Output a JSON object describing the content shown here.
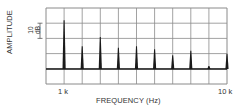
{
  "chart_data": {
    "type": "bar",
    "subtype": "spectrum-line",
    "title": "",
    "xlabel": "FREQUENCY (Hz)",
    "ylabel": "AMPLITUDE",
    "y_scale_annotation": "10 dB",
    "y_units_per_division": 10,
    "x_ticks": [
      {
        "value": 1000,
        "label": "1 k"
      },
      {
        "value": 10000,
        "label": "10 k"
      }
    ],
    "xlim": [
      0,
      10000
    ],
    "ylim_db_relative_to_baseline": [
      -10,
      40
    ],
    "grid": true,
    "grid_divisions": {
      "x": 10,
      "y": 5
    },
    "legend": null,
    "categories": [
      "1k",
      "2k",
      "3k",
      "4k",
      "5k",
      "6k",
      "7k",
      "8k",
      "9k",
      "10k"
    ],
    "x": [
      1000,
      2000,
      3000,
      4000,
      5000,
      6000,
      7000,
      8000,
      9000,
      10000
    ],
    "values": [
      32,
      15,
      21,
      14,
      15,
      13,
      9,
      12,
      2,
      10
    ],
    "value_units": "dB above baseline (approx.)"
  },
  "labels": {
    "ylabel": "AMPLITUDE",
    "scale_top": "10",
    "scale_bottom": "dB",
    "xtick_1k": "1 k",
    "xtick_10k": "10 k",
    "xlabel": "FREQUENCY (Hz)"
  },
  "colors": {
    "grid": "#8a8a8a",
    "trace": "#1a1a1a",
    "background": "#ffffff"
  }
}
